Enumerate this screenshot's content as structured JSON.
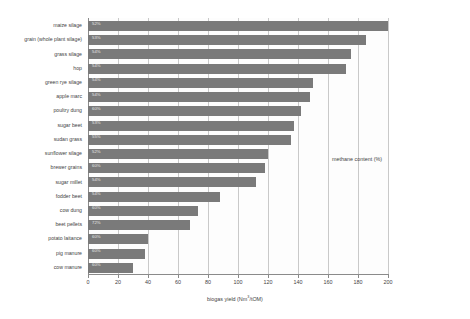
{
  "chart_data": {
    "type": "bar",
    "orientation": "horizontal",
    "title": "",
    "xlabel": "biogas yield (Nm3/tOM)",
    "xlabel_prefix": "biogas yield (Nm",
    "xlabel_sup": "3",
    "xlabel_suffix": "/tOM)",
    "ylabel": "",
    "annotation": "methane content (%)",
    "xlim": [
      0,
      200
    ],
    "xticks": [
      0,
      20,
      40,
      60,
      80,
      100,
      120,
      140,
      160,
      180,
      200
    ],
    "grid": true,
    "legend": "none",
    "bar_color": "#7a7a7a",
    "categories": [
      "maize silage",
      "grain (whole plant silage)",
      "grass silage",
      "hop",
      "green rye silage",
      "apple marc",
      "poultry dung",
      "sugar beet",
      "sudan grass",
      "sunflower silage",
      "brewer grains",
      "sugar millet",
      "fodder beet",
      "cow dung",
      "beet pellets",
      "potato laitance",
      "pig manure",
      "cow manure"
    ],
    "values": [
      200,
      185,
      175,
      172,
      150,
      148,
      142,
      137,
      135,
      120,
      118,
      112,
      88,
      73,
      68,
      40,
      38,
      30
    ],
    "methane_content": [
      "52%",
      "53%",
      "54%",
      "54%",
      "54%",
      "54%",
      "60%",
      "53%",
      "55%",
      "52%",
      "60%",
      "54%",
      "54%",
      "60%",
      "72%",
      "60%",
      "60%",
      "60%"
    ]
  }
}
